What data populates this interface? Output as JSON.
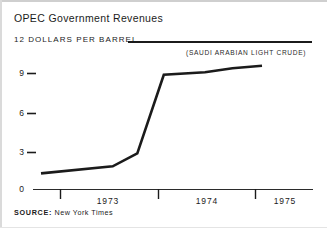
{
  "chart_data": {
    "type": "line",
    "title": "OPEC Government Revenues",
    "ylabel": "12 DOLLARS PER BARREL",
    "xlabel": "",
    "annotation": "(SAUDI ARABIAN LIGHT CRUDE)",
    "source": "SOURCE:",
    "source_value": "New York Times",
    "ylim": [
      0,
      12
    ],
    "yticks": [
      "0",
      "3",
      "6",
      "9"
    ],
    "ytick_values": [
      0,
      3,
      6,
      9
    ],
    "xticks": [
      "1973",
      "1974",
      "1975"
    ],
    "grid": false,
    "legend": "none",
    "line_color": "#1b1b1b",
    "series": [
      {
        "name": "Saudi Arabian Light Crude",
        "points": [
          {
            "x": 1972.55,
            "y": 1.25
          },
          {
            "x": 1973.28,
            "y": 1.8
          },
          {
            "x": 1973.53,
            "y": 2.8
          },
          {
            "x": 1973.8,
            "y": 8.9
          },
          {
            "x": 1974.22,
            "y": 9.1
          },
          {
            "x": 1974.5,
            "y": 9.4
          },
          {
            "x": 1974.8,
            "y": 9.6
          }
        ]
      }
    ]
  }
}
